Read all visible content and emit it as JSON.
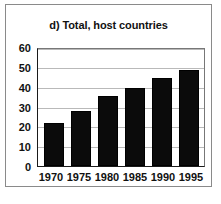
{
  "figure": {
    "panel_label": "d)",
    "border_color": "#8a8a8a",
    "background": "#ffffff"
  },
  "chart_data": {
    "type": "bar",
    "title": "d) Total, host countries",
    "xlabel": "",
    "ylabel": "",
    "categories": [
      "1970",
      "1975",
      "1980",
      "1985",
      "1990",
      "1995"
    ],
    "values": [
      22,
      28,
      36,
      40,
      45,
      49
    ],
    "ylim": [
      0,
      60
    ],
    "yticks": [
      "0",
      "10",
      "20",
      "30",
      "40",
      "50",
      "60"
    ],
    "ytick_values": [
      0,
      10,
      20,
      30,
      40,
      50,
      60
    ],
    "grid": true,
    "grid_axis": "y",
    "legend": null,
    "legend_position": "none",
    "bar_color": "#0b0b0b",
    "bar_edge_color": "#000000",
    "grid_color": "#b9b9b9",
    "axis_color": "#1a1a1a"
  }
}
